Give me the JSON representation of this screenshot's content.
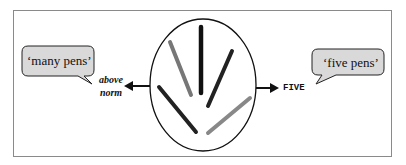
{
  "diagram": {
    "left_bubble": {
      "text": "‘many pens’"
    },
    "left_label": {
      "line1": "above",
      "line2": "norm"
    },
    "right_label": {
      "text": "FIVE"
    },
    "right_bubble": {
      "text": "‘five pens’"
    },
    "center": {
      "description": "ellipse containing five pens arranged in a fan",
      "pen_count": 5
    },
    "colors": {
      "bubble_fill": "#d9d9d9",
      "stroke": "#111111",
      "frame": "#8a8a8a"
    }
  }
}
